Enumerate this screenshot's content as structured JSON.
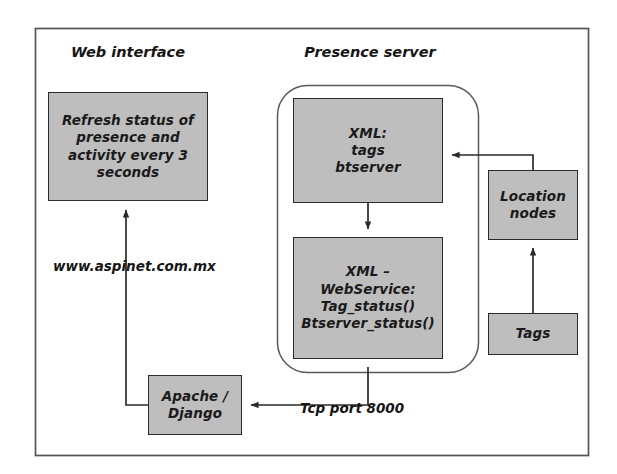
{
  "diagram": {
    "title_region": {
      "web": "Web interface",
      "presence": "Presence server"
    },
    "nodes": {
      "refresh": "Refresh status of\npresence and\nactivity every 3\nseconds",
      "xml_tags": "XML:\ntags\nbtserver",
      "xml_webservice": "XML –\nWebService:\nTag_status()\nBtserver_status()",
      "location_nodes": "Location\nnodes",
      "tags": "Tags",
      "apache": "Apache /\nDjango"
    },
    "edge_labels": {
      "url": "www.aspinet.com.mx",
      "tcp": "Tcp port 8000"
    },
    "colors": {
      "node_fill": "#bebebe",
      "node_stroke": "#2b2b2b",
      "frame_stroke": "#555555",
      "group_stroke": "#555555",
      "arrow": "#2b2b2b",
      "background": "#ffffff"
    }
  }
}
